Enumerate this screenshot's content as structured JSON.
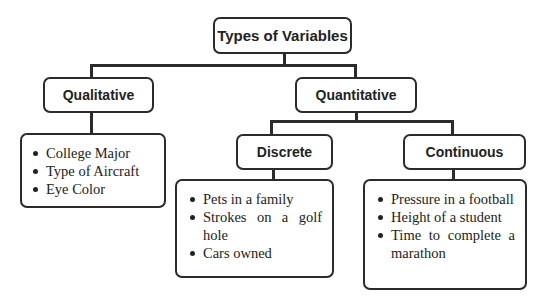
{
  "diagram": {
    "title": "Types of Variables",
    "nodes": {
      "qualitative": {
        "label": "Qualitative",
        "examples": [
          "College Major",
          "Type of Aircraft",
          "Eye Color"
        ]
      },
      "quantitative": {
        "label": "Quantitative",
        "children": {
          "discrete": {
            "label": "Discrete",
            "examples": [
              "Pets in a family",
              "Strokes on a golf hole",
              "Cars owned"
            ]
          },
          "continuous": {
            "label": "Continuous",
            "examples": [
              "Pressure in a football",
              "Height of a student",
              "Time to complete a marathon"
            ]
          }
        }
      }
    },
    "colors": {
      "stroke": "#2b2b2b",
      "text": "#222222",
      "background": "#ffffff"
    }
  }
}
